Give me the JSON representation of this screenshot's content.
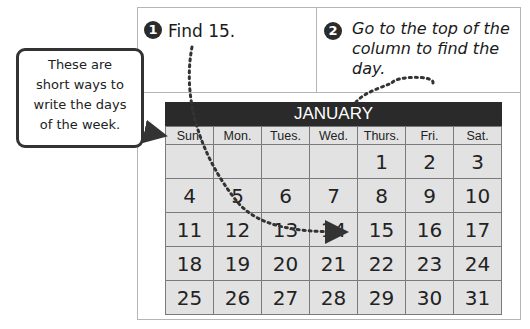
{
  "page_number": "88",
  "steps": [
    {
      "number": "1",
      "text": "Find 15."
    },
    {
      "number": "2",
      "text": "Go to the top of the column to find the day."
    }
  ],
  "callout": {
    "lines": [
      "These are",
      "short ways to",
      "write the days",
      "of the week."
    ]
  },
  "calendar": {
    "month": "JANUARY",
    "weekdays": [
      "Sun.",
      "Mon.",
      "Tues.",
      "Wed.",
      "Thurs.",
      "Fri.",
      "Sat."
    ],
    "weeks": [
      [
        "",
        "",
        "",
        "",
        "1",
        "2",
        "3"
      ],
      [
        "4",
        "5",
        "6",
        "7",
        "8",
        "9",
        "10"
      ],
      [
        "11",
        "12",
        "13",
        "14",
        "15",
        "16",
        "17"
      ],
      [
        "18",
        "19",
        "20",
        "21",
        "22",
        "23",
        "24"
      ],
      [
        "25",
        "26",
        "27",
        "28",
        "29",
        "30",
        "31"
      ]
    ],
    "highlight_date": "15",
    "highlight_day": "Thurs."
  },
  "colors": {
    "header_bg": "#2a2a2a",
    "cell_bg": "#e2e2e2",
    "border": "#7a7a7a"
  }
}
